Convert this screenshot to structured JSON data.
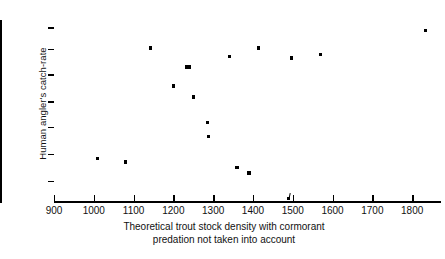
{
  "chart_data": {
    "type": "scatter",
    "title": "",
    "xlabel": "Theoretical trout stock density with cormorant predation not taken into account",
    "xlabel_line1": "Theoretical trout stock density with cormorant",
    "xlabel_line2": "predation not taken into account",
    "ylabel": "Human angler's catch-rate",
    "xlim": [
      900,
      1870
    ],
    "ylim": [
      0,
      10
    ],
    "grid": false,
    "legend": "none",
    "xticks": [
      900,
      1000,
      1100,
      1200,
      1300,
      1400,
      1500,
      1600,
      1700,
      1800
    ],
    "xticklabels": [
      "900",
      "1000",
      "1100",
      "1200",
      "1300",
      "1400",
      "1500",
      "1600",
      "1700",
      "1800"
    ],
    "yticks": [
      1.1,
      2.6,
      4.1,
      5.5,
      7.0,
      8.4,
      9.6
    ],
    "yticklabels": [
      "",
      "",
      "",
      "",
      "",
      "",
      ""
    ],
    "marker": "square",
    "marker_color": "#000000",
    "points": [
      {
        "x": 1010,
        "y": 2.35
      },
      {
        "x": 1080,
        "y": 2.15
      },
      {
        "x": 1143,
        "y": 8.45
      },
      {
        "x": 1200,
        "y": 6.35
      },
      {
        "x": 1232,
        "y": 7.4
      },
      {
        "x": 1240,
        "y": 7.4
      },
      {
        "x": 1250,
        "y": 5.75
      },
      {
        "x": 1285,
        "y": 4.35
      },
      {
        "x": 1288,
        "y": 3.55
      },
      {
        "x": 1342,
        "y": 8.0
      },
      {
        "x": 1360,
        "y": 1.85
      },
      {
        "x": 1390,
        "y": 1.55
      },
      {
        "x": 1414,
        "y": 8.45
      },
      {
        "x": 1490,
        "y": 0.15
      },
      {
        "x": 1496,
        "y": 7.9
      },
      {
        "x": 1570,
        "y": 8.1
      },
      {
        "x": 1833,
        "y": 9.4
      }
    ],
    "axis_marker_note": "tick-like mark on x-axis near 1490"
  }
}
